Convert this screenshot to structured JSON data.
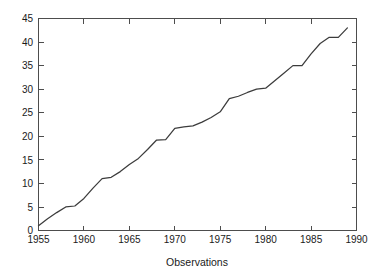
{
  "chart_data": {
    "type": "line",
    "title": "",
    "xlabel": "Observations",
    "ylabel": "",
    "xlim": [
      1955,
      1990
    ],
    "ylim": [
      0,
      45
    ],
    "xticks": [
      1955,
      1960,
      1965,
      1970,
      1975,
      1980,
      1985,
      1990
    ],
    "yticks": [
      0,
      5,
      10,
      15,
      20,
      25,
      30,
      35,
      40,
      45
    ],
    "xtick_labels": [
      "1955",
      "1960",
      "1965",
      "1970",
      "1975",
      "1980",
      "1985",
      "1990"
    ],
    "ytick_labels": [
      "0",
      "5",
      "10",
      "15",
      "20",
      "25",
      "30",
      "35",
      "40",
      "45"
    ],
    "grid": false,
    "legend": null,
    "line_color": "#3c3c3c",
    "frame_color": "#4d4d4d",
    "background_color": "#ffffff",
    "series": [
      {
        "name": "Observations",
        "x": [
          1955,
          1956,
          1957,
          1958,
          1959,
          1960,
          1961,
          1962,
          1963,
          1964,
          1965,
          1966,
          1967,
          1968,
          1969,
          1970,
          1971,
          1972,
          1973,
          1974,
          1975,
          1976,
          1977,
          1978,
          1979,
          1980,
          1981,
          1982,
          1983,
          1984,
          1985,
          1986,
          1987,
          1988,
          1989
        ],
        "y": [
          1,
          2.5,
          3.8,
          5,
          5.2,
          6.8,
          9,
          11,
          11.3,
          12.5,
          14,
          15.3,
          17.2,
          19.2,
          19.3,
          21.7,
          22,
          22.2,
          23,
          24,
          25.2,
          28,
          28.5,
          29.3,
          30,
          30.2,
          31.8,
          33.4,
          35,
          35,
          37.5,
          39.7,
          41,
          41,
          43
        ]
      }
    ]
  },
  "axis_labels": {
    "x_title": "Observations"
  }
}
